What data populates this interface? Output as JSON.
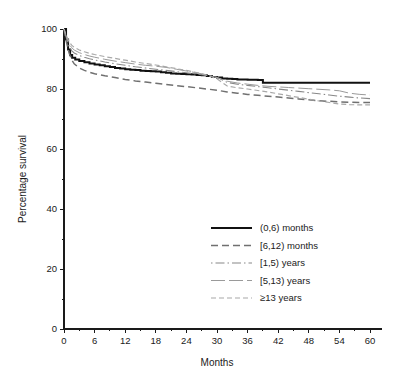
{
  "chart_data": {
    "type": "line",
    "title": "",
    "xlabel": "Months",
    "ylabel": "Percentage survival",
    "xlim": [
      0,
      60
    ],
    "ylim": [
      0,
      100
    ],
    "xticks": [
      0,
      6,
      12,
      18,
      24,
      30,
      36,
      42,
      48,
      54,
      60
    ],
    "xtick_labels": [
      "0",
      "6",
      "12",
      "18",
      "24",
      "30",
      "36",
      "42",
      "48",
      "54",
      "60"
    ],
    "x_minor_ticks": [
      3,
      9,
      15,
      21,
      27,
      33,
      39,
      45,
      51,
      57
    ],
    "yticks": [
      0,
      20,
      40,
      60,
      80,
      100
    ],
    "ytick_labels": [
      "0",
      "20",
      "40",
      "60",
      "80",
      "100"
    ],
    "y_minor_ticks": [
      10,
      30,
      50,
      70,
      90
    ],
    "grid": false,
    "legend_position": "center-right-lower",
    "series": [
      {
        "name": "(0,6) months",
        "style": "solid",
        "color": "#111111",
        "width": 2.0,
        "dasharray": "",
        "step": true,
        "x": [
          0,
          0.4,
          0.8,
          1.2,
          1.6,
          2.2,
          3,
          4,
          5,
          6,
          7,
          8,
          9,
          10,
          11,
          12,
          13,
          14,
          15,
          16,
          17,
          18,
          19,
          20,
          21,
          22,
          23,
          24,
          25,
          26,
          27,
          28,
          29,
          30,
          31,
          32,
          33,
          34,
          36,
          38,
          39,
          40,
          45,
          50,
          55,
          60
        ],
        "y": [
          100,
          96.5,
          93.2,
          91.3,
          90.4,
          89.8,
          89.3,
          88.9,
          88.5,
          88.2,
          87.9,
          87.6,
          87.3,
          87.0,
          86.8,
          86.6,
          86.4,
          86.3,
          86.1,
          86.0,
          85.9,
          85.8,
          85.6,
          85.4,
          85.2,
          85.1,
          85.0,
          84.9,
          84.8,
          84.7,
          84.6,
          84.3,
          84.0,
          83.8,
          83.5,
          83.4,
          83.3,
          83.2,
          83.1,
          83.0,
          82.1,
          82.1,
          82.1,
          82.1,
          82.1,
          82.1
        ]
      },
      {
        "name": "[6,12) months",
        "style": "dashed",
        "color": "#707070",
        "width": 1.5,
        "dasharray": "7,4",
        "step": false,
        "x": [
          0,
          0.5,
          1,
          1.5,
          2,
          3,
          4,
          5,
          6,
          8,
          10,
          12,
          14,
          16,
          18,
          20,
          22,
          24,
          26,
          28,
          30,
          32,
          34,
          36,
          38,
          40,
          42,
          44,
          46,
          48,
          50,
          52,
          54,
          56,
          58,
          60
        ],
        "y": [
          100,
          95.5,
          92.0,
          89.8,
          88.4,
          87.0,
          86.2,
          85.6,
          85.1,
          84.4,
          83.8,
          83.2,
          82.7,
          82.3,
          81.9,
          81.5,
          81.1,
          80.8,
          80.4,
          80.0,
          79.6,
          79.0,
          78.6,
          78.2,
          77.9,
          77.6,
          77.3,
          77.0,
          76.7,
          76.4,
          76.1,
          75.9,
          75.7,
          75.6,
          75.5,
          75.5
        ]
      },
      {
        "name": "[1,5) years",
        "style": "dash-dot",
        "color": "#888888",
        "width": 1.1,
        "dasharray": "1.5,3,9,3",
        "step": false,
        "x": [
          0,
          0.5,
          1,
          1.5,
          2,
          3,
          4,
          5,
          6,
          8,
          10,
          12,
          14,
          16,
          18,
          20,
          22,
          24,
          26,
          28,
          30,
          32,
          34,
          36,
          38,
          40,
          42,
          44,
          46,
          48,
          50,
          52,
          54,
          56,
          58,
          60
        ],
        "y": [
          100,
          96.8,
          94.2,
          92.8,
          92.0,
          91.2,
          90.6,
          90.1,
          89.7,
          89.0,
          88.4,
          87.9,
          87.4,
          87.0,
          86.6,
          86.2,
          85.8,
          85.4,
          85.0,
          84.5,
          83.9,
          82.2,
          81.6,
          81.2,
          80.8,
          80.4,
          80.0,
          79.6,
          79.2,
          78.8,
          78.4,
          78.0,
          77.6,
          77.3,
          77.0,
          76.8
        ]
      },
      {
        "name": "[5,13) years",
        "style": "long-dash",
        "color": "#9a9a9a",
        "width": 1.0,
        "dasharray": "14,4",
        "step": false,
        "x": [
          0,
          0.5,
          1,
          1.5,
          2,
          3,
          4,
          5,
          6,
          8,
          10,
          12,
          14,
          16,
          18,
          20,
          22,
          24,
          26,
          28,
          30,
          32,
          34,
          36,
          38,
          40,
          42,
          44,
          46,
          48,
          50,
          52,
          54,
          56,
          58,
          60
        ],
        "y": [
          100,
          97.2,
          95.0,
          93.8,
          93.0,
          92.1,
          91.5,
          91.0,
          90.6,
          89.9,
          89.3,
          88.8,
          88.3,
          87.9,
          87.6,
          87.2,
          86.6,
          86.0,
          85.4,
          84.7,
          83.8,
          82.6,
          82.0,
          81.6,
          81.2,
          80.9,
          80.7,
          80.5,
          80.3,
          80.1,
          79.9,
          79.7,
          79.4,
          78.6,
          78.2,
          78.0
        ]
      },
      {
        "name": "≥13 years",
        "style": "fine-dashed",
        "color": "#a8a8a8",
        "width": 1.2,
        "dasharray": "5,3",
        "step": false,
        "x": [
          0,
          0.5,
          1,
          1.5,
          2,
          3,
          4,
          5,
          6,
          8,
          10,
          12,
          14,
          16,
          18,
          20,
          22,
          24,
          26,
          28,
          30,
          32,
          34,
          36,
          38,
          40,
          42,
          44,
          46,
          48,
          50,
          52,
          54,
          56,
          58,
          60
        ],
        "y": [
          100,
          97.6,
          95.8,
          94.6,
          93.9,
          93.0,
          92.4,
          91.9,
          91.5,
          90.8,
          90.2,
          89.6,
          89.0,
          88.5,
          88.0,
          87.4,
          86.8,
          86.2,
          85.5,
          84.6,
          83.4,
          81.0,
          80.4,
          80.0,
          79.5,
          79.0,
          78.4,
          77.8,
          77.2,
          76.6,
          76.0,
          75.5,
          75.0,
          74.8,
          74.7,
          74.7
        ]
      }
    ]
  },
  "legend": {
    "items": [
      {
        "label": "(0,6) months"
      },
      {
        "label": "[6,12) months"
      },
      {
        "label": "[1,5) years"
      },
      {
        "label": "[5,13) years"
      },
      {
        "label": "≥13 years"
      }
    ]
  }
}
